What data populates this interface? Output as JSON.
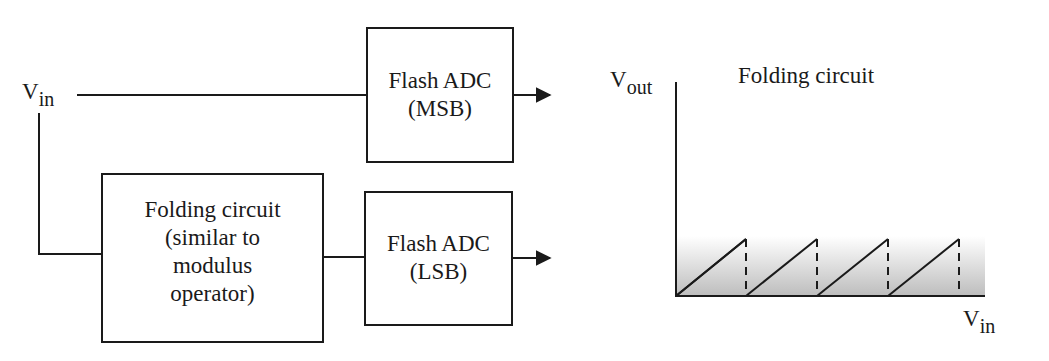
{
  "input": {
    "label_main": "V",
    "label_sub": "in"
  },
  "blocks": {
    "flash_msb": {
      "line1": "Flash ADC",
      "line2": "(MSB)"
    },
    "folding": {
      "line1": "Folding circuit",
      "line2": "(similar to",
      "line3": "modulus",
      "line4": "operator)"
    },
    "flash_lsb": {
      "line1": "Flash ADC",
      "line2": "(LSB)"
    }
  },
  "graph": {
    "title": "Folding circuit",
    "y_axis": {
      "label_main": "V",
      "label_sub": "out"
    },
    "x_axis": {
      "label_main": "V",
      "label_sub": "in"
    },
    "sawtooth_periods": 4,
    "fill_color": "#bdbdbd"
  },
  "colors": {
    "line": "#1a1a1a",
    "background": "#ffffff"
  }
}
